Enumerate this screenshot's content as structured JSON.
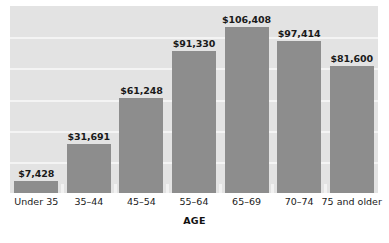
{
  "chart_data": {
    "type": "bar",
    "title": "",
    "subtitle": "",
    "xlabel": "AGE",
    "ylabel": "",
    "categories": [
      "Under 35",
      "35–44",
      "45–54",
      "55–64",
      "65–69",
      "70–74",
      "75 and older"
    ],
    "values": [
      7428,
      31691,
      61248,
      91330,
      106408,
      97414,
      81600
    ],
    "value_labels": [
      "$7,428",
      "$31,691",
      "$61,248",
      "$91,330",
      "$106,408",
      "$97,414",
      "$81,600"
    ],
    "ylim": [
      0,
      120000
    ],
    "grid": true,
    "gridlines": [
      20000,
      40000,
      60000,
      80000,
      100000
    ],
    "legend": "none",
    "bar_color": "#8d8d8d",
    "plot_background": "#e3e3e3",
    "gridline_color": "#f4f4f4",
    "page_background": "#ffffff",
    "text_color": "#1a1a1a"
  }
}
